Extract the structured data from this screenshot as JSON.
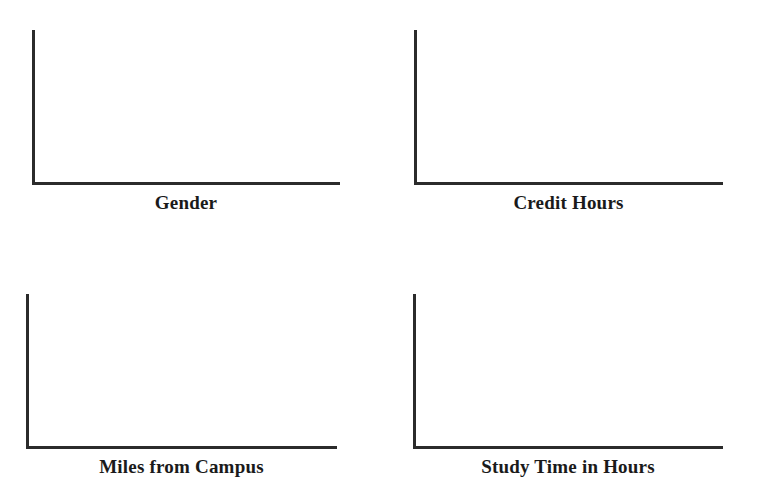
{
  "page": {
    "background_color": "#ffffff",
    "axis_color": "#2b2b2b",
    "label_color": "#1a1a1a",
    "width": 757,
    "height": 498
  },
  "chart_data": [
    {
      "type": "bar",
      "title": "",
      "xlabel": "Gender",
      "ylabel": "",
      "categories": [],
      "values": [],
      "tick_labels": {
        "x": [],
        "y": []
      },
      "grid": false,
      "legend": null,
      "note": "empty axes - no data plotted"
    },
    {
      "type": "bar",
      "title": "",
      "xlabel": "Credit Hours",
      "ylabel": "",
      "categories": [],
      "values": [],
      "tick_labels": {
        "x": [],
        "y": []
      },
      "grid": false,
      "legend": null,
      "note": "empty axes - no data plotted"
    },
    {
      "type": "bar",
      "title": "",
      "xlabel": "Miles from Campus",
      "ylabel": "",
      "categories": [],
      "values": [],
      "tick_labels": {
        "x": [],
        "y": []
      },
      "grid": false,
      "legend": null,
      "note": "empty axes - no data plotted"
    },
    {
      "type": "bar",
      "title": "",
      "xlabel": "Study Time in Hours",
      "ylabel": "",
      "categories": [],
      "values": [],
      "tick_labels": {
        "x": [],
        "y": []
      },
      "grid": false,
      "legend": null,
      "note": "empty axes - no data plotted"
    }
  ],
  "panels": [
    {
      "id": "gender",
      "label": "Gender"
    },
    {
      "id": "credit",
      "label": "Credit Hours"
    },
    {
      "id": "miles",
      "label": "Miles from Campus"
    },
    {
      "id": "study",
      "label": "Study Time in Hours"
    }
  ]
}
